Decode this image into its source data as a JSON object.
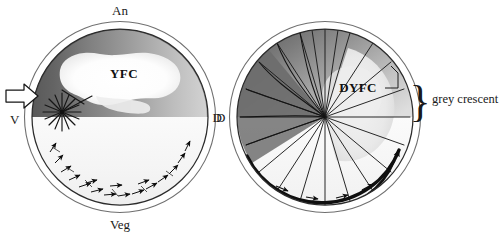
{
  "figure": {
    "background_color": "#ffffff",
    "panels": [
      {
        "id": "left-panel",
        "name": "pre-rotation-egg",
        "center_x": 120,
        "center_y": 117,
        "radius": 88,
        "membrane_radius": 96,
        "axis_labels": {
          "animal": "An",
          "vegetal": "Veg",
          "ventral": "V",
          "dorsal": "D"
        },
        "region_label": "YFC",
        "sperm_entry_arrow": "open-arrow-pointing-right",
        "starburst_rays": 10,
        "cortical_arrow_count": 17,
        "shading": {
          "dark_cortex": "#5e5e5e",
          "mid_cortex": "#8c8c8c",
          "light_cortex": "#c9c9c9",
          "vegetal_pole": "#f4f4f4",
          "yfc_patch": "#fbfbfb"
        }
      },
      {
        "id": "right-panel",
        "name": "post-rotation-egg",
        "center_x": 325,
        "center_y": 117,
        "radius": 88,
        "membrane_radius": 96,
        "axis_labels": {
          "dorsal": "D"
        },
        "region_label": "DYFC",
        "spoke_count": 22,
        "crescent_annotation": "grey crescent",
        "shading": {
          "dark_crescent": "#6a6a6a",
          "mid_cortex": "#9a9a9a",
          "light_cortex": "#d2d2d2",
          "vegetal_pole": "#f6f6f6",
          "dyfc_patch": "#ececec"
        }
      }
    ],
    "colors": {
      "outline": "#2b2b2b",
      "membrane_outline": "#7a7a7a",
      "arrow_fill": "#111111",
      "text": "#1a1a1a"
    },
    "brace_glyph": "}"
  }
}
